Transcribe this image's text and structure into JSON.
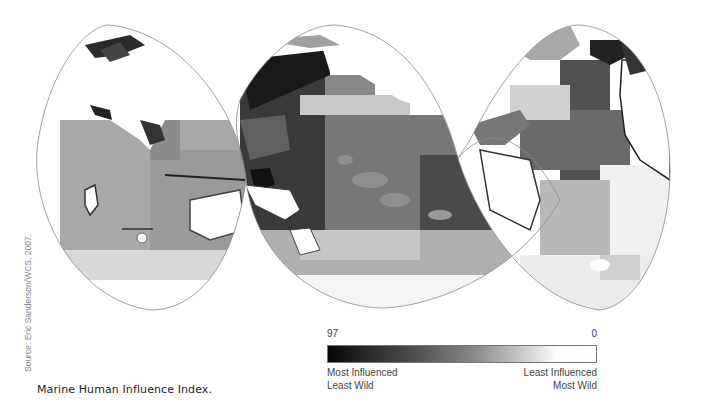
{
  "figure": {
    "caption": "Marine Human Influence Index.",
    "source": "Source: Eric Sanderson/WCS, 2007.",
    "projection": "interrupted homolosine (3 lobes)",
    "lobes": [
      {
        "name": "Indian Ocean lobe",
        "regions": [
          "Europe/Asia landmass",
          "Africa east",
          "Indian Ocean",
          "Australia west",
          "Southern Ocean"
        ]
      },
      {
        "name": "Pacific Ocean lobe",
        "regions": [
          "East Asia coast",
          "Pacific Ocean",
          "Australia east",
          "New Zealand",
          "Americas west coast"
        ]
      },
      {
        "name": "Atlantic Ocean lobe",
        "regions": [
          "North America east",
          "Greenland",
          "Atlantic Ocean",
          "Europe west",
          "Africa west",
          "South America east"
        ]
      }
    ]
  },
  "legend": {
    "max_value": "97",
    "min_value": "0",
    "left_label_1": "Most Influenced",
    "left_label_2": "Least Wild",
    "right_label_1": "Least Influenced",
    "right_label_2": "Most Wild",
    "colors": {
      "high": "#050505",
      "low": "#ffffff"
    }
  }
}
